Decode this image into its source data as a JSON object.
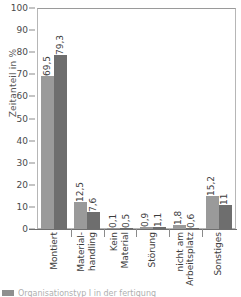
{
  "chart_data": {
    "type": "bar",
    "title": "",
    "subtitle": "",
    "xlabel": "",
    "ylabel": "Zeitanteil in %",
    "ylim": [
      0,
      100
    ],
    "yticks": [
      0,
      10,
      20,
      30,
      40,
      50,
      60,
      70,
      80,
      90,
      100
    ],
    "ytick_labels": [
      "0",
      "10",
      "20",
      "30",
      "40",
      "50",
      "60",
      "70",
      "80",
      "90",
      "100"
    ],
    "grid": false,
    "legend_position": "bottom-left",
    "categories": [
      "Montiert",
      "Material-handling",
      "Kein Material",
      "Störung",
      "nicht am Arbeitsplatz",
      "Sonstiges"
    ],
    "category_lines": [
      [
        "Montiert"
      ],
      [
        "Material-",
        "handling"
      ],
      [
        "Kein",
        "Material"
      ],
      [
        "Störung"
      ],
      [
        "nicht am",
        "Arbeitsplatz"
      ],
      [
        "Sonstiges"
      ]
    ],
    "series": [
      {
        "name": "Serie 1",
        "color": "#9a9a9a",
        "values": [
          69.5,
          12.5,
          0.1,
          0.9,
          1.8,
          15.2
        ],
        "labels": [
          "69,5",
          "12,5",
          "0,1",
          "0,9",
          "1,8",
          "15,2"
        ]
      },
      {
        "name": "Serie 2",
        "color": "#6e6e6e",
        "values": [
          79.3,
          7.6,
          0.5,
          1.1,
          0.6,
          11
        ],
        "labels": [
          "79,3",
          "7,6",
          "0,5",
          "1,1",
          "0,6",
          "11"
        ]
      }
    ]
  },
  "legend": {
    "swatch_color": "#8f8f8f",
    "text": "Organisationstyp I in der fertigung"
  }
}
